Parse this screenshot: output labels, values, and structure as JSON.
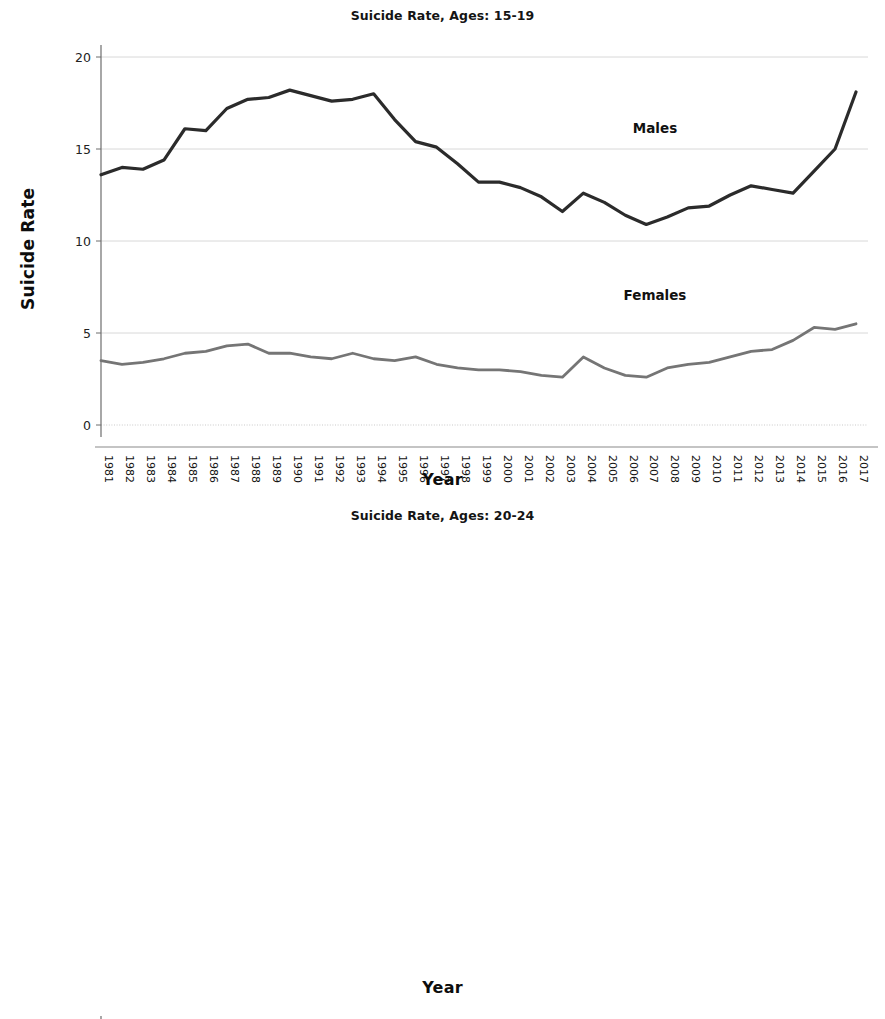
{
  "figure": {
    "background": "#ffffff",
    "male_color": "#2b2b2b",
    "female_color": "#757575",
    "grid_color": "#d8d8d8",
    "axis_color": "#6d6d6d"
  },
  "charts": [
    {
      "id": "chart-top",
      "title": "Suicide Rate, Ages: 15-19",
      "ylabel": "Suicide Rate",
      "xlabel": "Year",
      "male_label": "Males",
      "female_label": "Females"
    },
    {
      "id": "chart-bottom",
      "title": "Suicide Rate, Ages: 20-24",
      "ylabel": "Suicide Rate",
      "xlabel": "Year",
      "male_label": "Males",
      "female_label": "Females"
    }
  ],
  "chart_data": [
    {
      "type": "line",
      "title": "Suicide Rate, Ages: 15-19",
      "xlabel": "Year",
      "ylabel": "Suicide Rate",
      "ylim": [
        0,
        20
      ],
      "yticks": [
        0,
        5,
        10,
        15,
        20
      ],
      "grid": true,
      "legend": "inline-annotation",
      "x": [
        1981,
        1982,
        1983,
        1984,
        1985,
        1986,
        1987,
        1988,
        1989,
        1990,
        1991,
        1992,
        1993,
        1994,
        1995,
        1996,
        1997,
        1998,
        1999,
        2000,
        2001,
        2002,
        2003,
        2004,
        2005,
        2006,
        2007,
        2008,
        2009,
        2010,
        2011,
        2012,
        2013,
        2014,
        2015,
        2016,
        2017
      ],
      "categories": [
        "1981",
        "1982",
        "1983",
        "1984",
        "1985",
        "1986",
        "1987",
        "1988",
        "1989",
        "1990",
        "1991",
        "1992",
        "1993",
        "1994",
        "1995",
        "1996",
        "1997",
        "1998",
        "1999",
        "2000",
        "2001",
        "2002",
        "2003",
        "2004",
        "2005",
        "2006",
        "2007",
        "2008",
        "2009",
        "2010",
        "2011",
        "2012",
        "2013",
        "2014",
        "2015",
        "2016",
        "2017"
      ],
      "series": [
        {
          "name": "Males",
          "color": "#2b2b2b",
          "values": [
            13.6,
            14.0,
            13.9,
            14.4,
            16.1,
            16.0,
            17.2,
            17.7,
            17.8,
            18.2,
            17.9,
            17.6,
            17.7,
            18.0,
            16.6,
            15.4,
            15.1,
            14.2,
            13.2,
            13.2,
            12.9,
            12.4,
            11.6,
            12.6,
            12.1,
            11.4,
            10.9,
            11.3,
            11.8,
            11.9,
            12.5,
            13.0,
            12.8,
            12.6,
            13.8,
            15.0,
            18.1
          ]
        },
        {
          "name": "Females",
          "color": "#757575",
          "values": [
            3.5,
            3.3,
            3.4,
            3.6,
            3.9,
            4.0,
            4.3,
            4.4,
            3.9,
            3.9,
            3.7,
            3.6,
            3.9,
            3.6,
            3.5,
            3.7,
            3.3,
            3.1,
            3.0,
            3.0,
            2.9,
            2.7,
            2.6,
            3.7,
            3.1,
            2.7,
            2.6,
            3.1,
            3.3,
            3.4,
            3.7,
            4.0,
            4.1,
            4.6,
            5.3,
            5.2,
            5.5
          ]
        }
      ]
    },
    {
      "type": "line",
      "title": "Suicide Rate, Ages: 20-24",
      "xlabel": "Year",
      "ylabel": "Suicide Rate",
      "ylim": [
        0,
        30
      ],
      "yticks": [
        0,
        5,
        10,
        15,
        20,
        25,
        30
      ],
      "grid": true,
      "legend": "inline-annotation",
      "x": [
        1981,
        1982,
        1983,
        1984,
        1985,
        1986,
        1987,
        1988,
        1989,
        1990,
        1991,
        1992,
        1993,
        1994,
        1995,
        1996,
        1997,
        1998,
        1999,
        2000,
        2001,
        2002,
        2003,
        2004,
        2005,
        2006,
        2007,
        2008,
        2009,
        2010,
        2011,
        2012,
        2013,
        2014,
        2015,
        2016,
        2017
      ],
      "categories": [
        "1981",
        "1982",
        "1983",
        "1984",
        "1985",
        "1986",
        "1987",
        "1988",
        "1989",
        "1990",
        "1991",
        "1992",
        "1993",
        "1994",
        "1995",
        "1996",
        "1997",
        "1998",
        "1999",
        "2000",
        "2001",
        "2002",
        "2003",
        "2004",
        "2005",
        "2006",
        "2007",
        "2008",
        "2009",
        "2010",
        "2011",
        "2012",
        "2013",
        "2014",
        "2015",
        "2016",
        "2017"
      ],
      "series": [
        {
          "name": "Males",
          "color": "#2b2b2b",
          "values": [
            25.7,
            25.0,
            24.1,
            25.6,
            25.7,
            26.0,
            25.4,
            24.9,
            25.5,
            25.7,
            25.3,
            25.3,
            25.9,
            28.1,
            26.6,
            23.0,
            22.6,
            21.0,
            21.5,
            21.3,
            20.7,
            21.2,
            21.1,
            21.3,
            20.6,
            21.2,
            21.0,
            21.1,
            21.0,
            22.4,
            22.5,
            22.3,
            22.1,
            23.0,
            24.5,
            26.0,
            27.5
          ]
        },
        {
          "name": "Females",
          "color": "#757575",
          "values": [
            5.6,
            5.2,
            5.1,
            5.1,
            5.0,
            4.9,
            4.7,
            4.3,
            4.3,
            4.3,
            4.1,
            4.2,
            4.6,
            4.1,
            4.3,
            3.8,
            3.8,
            3.7,
            3.5,
            3.4,
            3.3,
            3.6,
            3.8,
            4.1,
            3.8,
            4.1,
            4.3,
            4.4,
            4.4,
            4.8,
            5.1,
            4.9,
            5.4,
            5.3,
            5.7,
            6.0,
            6.5
          ]
        }
      ]
    }
  ]
}
